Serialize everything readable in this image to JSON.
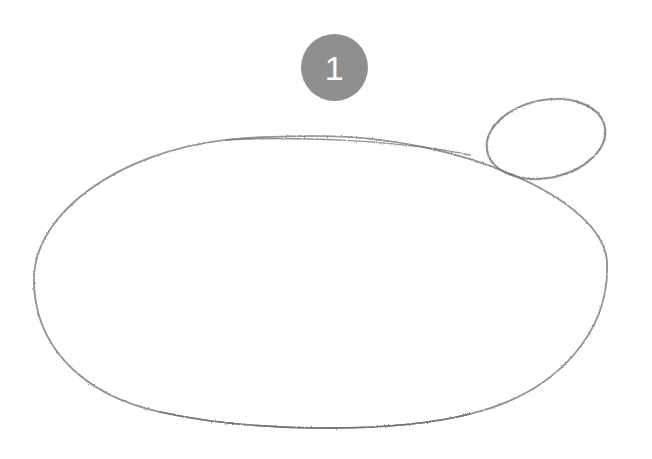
{
  "page": {
    "width": 652,
    "height": 459,
    "background_color": "#ffffff"
  },
  "badge": {
    "label": "1",
    "fill_color": "#8f8f8f",
    "text_color": "#ffffff",
    "shape": "circle",
    "center_x": 334,
    "center_y": 67,
    "diameter": 67,
    "font_size": 34
  },
  "sketch": {
    "stroke_color": "#8b8b91",
    "stroke_color_dark": "#6f6f76",
    "stroke_width": 1.6,
    "shapes": [
      {
        "name": "large-ellipse",
        "type": "ellipse",
        "center_x": 320,
        "center_y": 280,
        "radius_x": 287,
        "radius_y": 144,
        "rotation_deg": -2
      },
      {
        "name": "small-ellipse",
        "type": "ellipse",
        "center_x": 546,
        "center_y": 139,
        "radius_x": 60,
        "radius_y": 39,
        "rotation_deg": -12
      }
    ]
  }
}
